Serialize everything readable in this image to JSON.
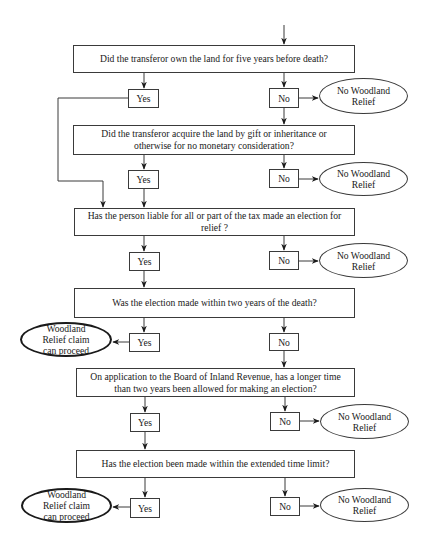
{
  "questions": [
    {
      "text": "Did the transferor own the land for five years before death?"
    },
    {
      "text": "Did the transferor acquire the land by gift or inheritance or otherwise for no monetary consideration?"
    },
    {
      "text": "Has the person liable for all or part of the tax made an election for relief ?"
    },
    {
      "text": "Was the election made within two years of the death?"
    },
    {
      "text": "On application to the Board of Inland Revenue, has a longer time than two years been allowed for making an election?"
    },
    {
      "text": "Has the election been made within the extended time limit?"
    }
  ],
  "answers": {
    "yes": "Yes",
    "no": "No"
  },
  "outcomes": {
    "negative": "No Woodland Relief",
    "positive": "Woodland Relief claim can proceed"
  },
  "colors": {
    "line": "#3a3a3a",
    "background": "#ffffff"
  }
}
